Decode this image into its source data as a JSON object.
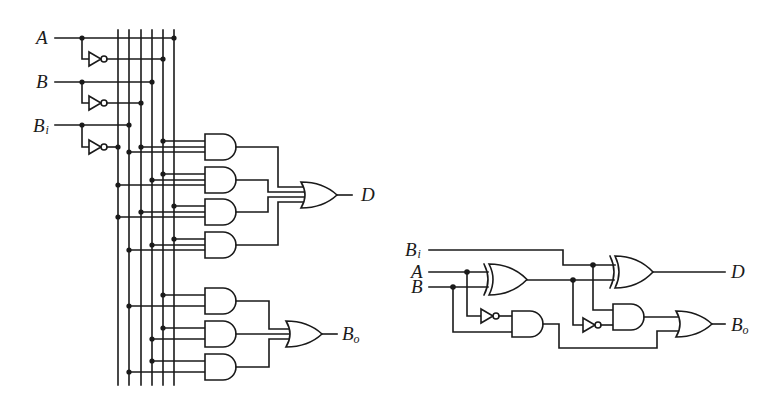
{
  "diagram": {
    "type": "logic-circuit",
    "colors": {
      "wire": "#1a1a1a",
      "background": "#ffffff"
    }
  },
  "left_circuit": {
    "inputs": [
      {
        "base": "A",
        "sub": ""
      },
      {
        "base": "B",
        "sub": ""
      },
      {
        "base": "B",
        "sub": "i"
      }
    ],
    "bus_lines": [
      "B_i'",
      "B_i",
      "B'",
      "B",
      "A'",
      "A"
    ],
    "difference_and_terms": [
      [
        "A'",
        "B'",
        "B_i"
      ],
      [
        "A'",
        "B",
        "B_i'"
      ],
      [
        "A",
        "B'",
        "B_i'"
      ],
      [
        "A",
        "B",
        "B_i"
      ]
    ],
    "borrow_and_terms": [
      [
        "A'",
        "B_i"
      ],
      [
        "A'",
        "B"
      ],
      [
        "B",
        "B_i"
      ]
    ],
    "outputs": [
      {
        "base": "D",
        "sub": ""
      },
      {
        "base": "B",
        "sub": "o"
      }
    ]
  },
  "right_circuit": {
    "inputs": [
      {
        "base": "B",
        "sub": "i"
      },
      {
        "base": "A",
        "sub": ""
      },
      {
        "base": "B",
        "sub": ""
      }
    ],
    "gates": [
      "XOR(A,B)",
      "XOR(A⊕B,B_i)",
      "AND(A',B)",
      "AND((A⊕B)',B_i)",
      "OR"
    ],
    "outputs": [
      {
        "base": "D",
        "sub": ""
      },
      {
        "base": "B",
        "sub": "o"
      }
    ]
  }
}
